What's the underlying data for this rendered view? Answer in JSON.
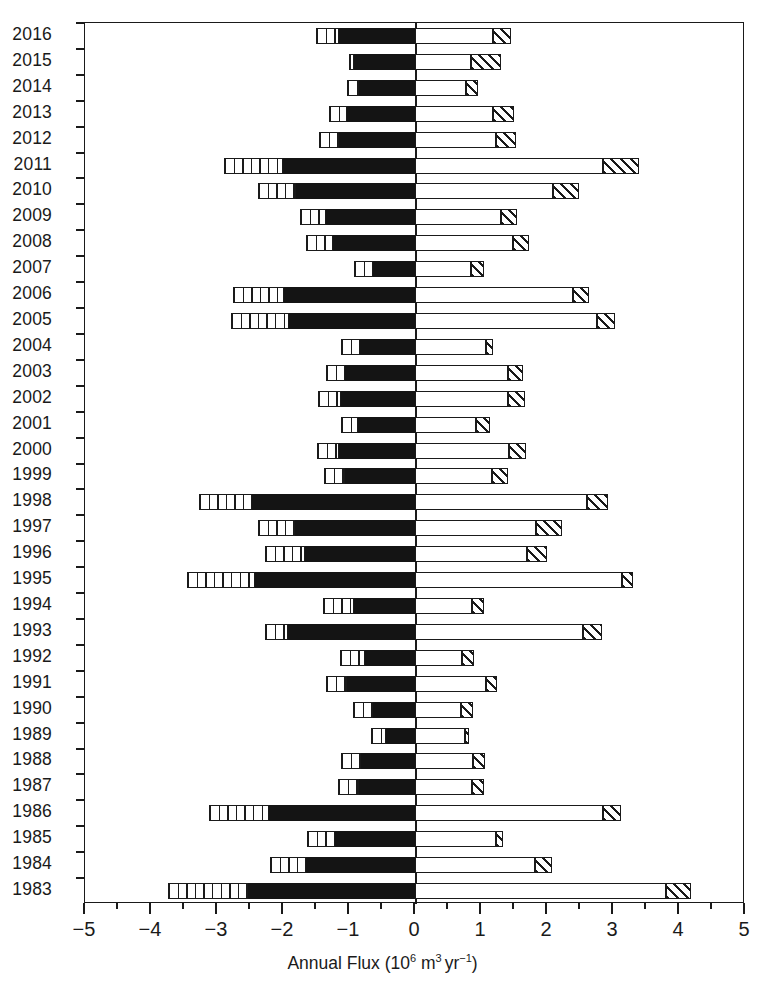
{
  "chart_data": {
    "type": "bar",
    "orientation": "horizontal",
    "title": "",
    "xlabel": "Annual Flux (10^6 m^3 yr^-1)",
    "xlabel_parts": {
      "text_lead": "Annual Flux (10",
      "exp1": "6",
      "unit_m": " m",
      "exp2": "3",
      "unit_yr": "yr",
      "exp3": "−1",
      "text_tail": ")"
    },
    "ylabel": "",
    "xlim": [
      -5,
      5
    ],
    "xticks": [
      -5,
      -4,
      -3,
      -2,
      -1,
      0,
      1,
      2,
      3,
      4,
      5
    ],
    "xtick_labels": [
      "−5",
      "−4",
      "−3",
      "−2",
      "−1",
      "0",
      "1",
      "2",
      "3",
      "4",
      "5"
    ],
    "x_minor_tick_step": 0.5,
    "grid": false,
    "legend": null,
    "categories": [
      "2016",
      "2015",
      "2014",
      "2013",
      "2012",
      "2011",
      "2010",
      "2009",
      "2008",
      "2007",
      "2006",
      "2005",
      "2004",
      "2003",
      "2002",
      "2001",
      "2000",
      "1999",
      "1998",
      "1997",
      "1996",
      "1995",
      "1994",
      "1993",
      "1992",
      "1991",
      "1990",
      "1989",
      "1988",
      "1987",
      "1986",
      "1985",
      "1984",
      "1983"
    ],
    "series": [
      {
        "name": "negative-vertical-hatch",
        "pattern": "vertical-hatch",
        "color": "#ffffff"
      },
      {
        "name": "negative-solid",
        "pattern": "solid",
        "color": "#141414"
      },
      {
        "name": "positive-white",
        "pattern": "open",
        "color": "#ffffff"
      },
      {
        "name": "positive-diagonal-hatch",
        "pattern": "diagonal-hatch",
        "color": "#ffffff"
      }
    ],
    "rows": [
      {
        "year": "2016",
        "neg_start": -1.5,
        "neg_hatch_end": -1.15,
        "neg_end": 0,
        "pos_white_end": 1.18,
        "pos_end": 1.45
      },
      {
        "year": "2015",
        "neg_start": -1.0,
        "neg_hatch_end": -0.92,
        "neg_end": 0,
        "pos_white_end": 0.85,
        "pos_end": 1.3
      },
      {
        "year": "2014",
        "neg_start": -1.03,
        "neg_hatch_end": -0.85,
        "neg_end": 0,
        "pos_white_end": 0.78,
        "pos_end": 0.96
      },
      {
        "year": "2013",
        "neg_start": -1.3,
        "neg_hatch_end": -1.03,
        "neg_end": 0,
        "pos_white_end": 1.18,
        "pos_end": 1.5
      },
      {
        "year": "2012",
        "neg_start": -1.45,
        "neg_hatch_end": -1.15,
        "neg_end": 0,
        "pos_white_end": 1.22,
        "pos_end": 1.53
      },
      {
        "year": "2011",
        "neg_start": -2.9,
        "neg_hatch_end": -2.0,
        "neg_end": 0,
        "pos_white_end": 2.85,
        "pos_end": 3.4
      },
      {
        "year": "2010",
        "neg_start": -2.38,
        "neg_hatch_end": -1.8,
        "neg_end": 0,
        "pos_white_end": 2.09,
        "pos_end": 2.48
      },
      {
        "year": "2009",
        "neg_start": -1.75,
        "neg_hatch_end": -1.35,
        "neg_end": 0,
        "pos_white_end": 1.3,
        "pos_end": 1.55
      },
      {
        "year": "2008",
        "neg_start": -1.65,
        "neg_hatch_end": -1.24,
        "neg_end": 0,
        "pos_white_end": 1.48,
        "pos_end": 1.73
      },
      {
        "year": "2007",
        "neg_start": -0.92,
        "neg_hatch_end": -0.64,
        "neg_end": 0,
        "pos_white_end": 0.85,
        "pos_end": 1.04
      },
      {
        "year": "2006",
        "neg_start": -2.76,
        "neg_hatch_end": -1.98,
        "neg_end": 0,
        "pos_white_end": 2.4,
        "pos_end": 2.64
      },
      {
        "year": "2005",
        "neg_start": -2.79,
        "neg_hatch_end": -1.91,
        "neg_end": 0,
        "pos_white_end": 2.76,
        "pos_end": 3.03
      },
      {
        "year": "2004",
        "neg_start": -1.12,
        "neg_hatch_end": -0.83,
        "neg_end": 0,
        "pos_white_end": 1.08,
        "pos_end": 1.18
      },
      {
        "year": "2003",
        "neg_start": -1.35,
        "neg_hatch_end": -1.06,
        "neg_end": 0,
        "pos_white_end": 1.41,
        "pos_end": 1.63
      },
      {
        "year": "2002",
        "neg_start": -1.47,
        "neg_hatch_end": -1.12,
        "neg_end": 0,
        "pos_white_end": 1.41,
        "pos_end": 1.67
      },
      {
        "year": "2001",
        "neg_start": -1.12,
        "neg_hatch_end": -0.86,
        "neg_end": 0,
        "pos_white_end": 0.93,
        "pos_end": 1.14
      },
      {
        "year": "2000",
        "neg_start": -1.48,
        "neg_hatch_end": -1.15,
        "neg_end": 0,
        "pos_white_end": 1.42,
        "pos_end": 1.68
      },
      {
        "year": "1999",
        "neg_start": -1.38,
        "neg_hatch_end": -1.06,
        "neg_end": 0,
        "pos_white_end": 1.16,
        "pos_end": 1.41
      },
      {
        "year": "1998",
        "neg_start": -3.27,
        "neg_hatch_end": -2.47,
        "neg_end": 0,
        "pos_white_end": 2.6,
        "pos_end": 2.92
      },
      {
        "year": "1997",
        "neg_start": -2.38,
        "neg_hatch_end": -1.82,
        "neg_end": 0,
        "pos_white_end": 1.83,
        "pos_end": 2.22
      },
      {
        "year": "1996",
        "neg_start": -2.27,
        "neg_hatch_end": -1.67,
        "neg_end": 0,
        "pos_white_end": 1.7,
        "pos_end": 2.0
      },
      {
        "year": "1995",
        "neg_start": -3.45,
        "neg_hatch_end": -2.42,
        "neg_end": 0,
        "pos_white_end": 3.13,
        "pos_end": 3.3
      },
      {
        "year": "1994",
        "neg_start": -1.4,
        "neg_hatch_end": -0.92,
        "neg_end": 0,
        "pos_white_end": 0.87,
        "pos_end": 1.05
      },
      {
        "year": "1993",
        "neg_start": -2.27,
        "neg_hatch_end": -1.92,
        "neg_end": 0,
        "pos_white_end": 2.54,
        "pos_end": 2.84
      },
      {
        "year": "1992",
        "neg_start": -1.13,
        "neg_hatch_end": -0.76,
        "neg_end": 0,
        "pos_white_end": 0.71,
        "pos_end": 0.89
      },
      {
        "year": "1991",
        "neg_start": -1.35,
        "neg_hatch_end": -1.03,
        "neg_end": 0,
        "pos_white_end": 1.07,
        "pos_end": 1.24
      },
      {
        "year": "1990",
        "neg_start": -0.94,
        "neg_hatch_end": -0.64,
        "neg_end": 0,
        "pos_white_end": 0.7,
        "pos_end": 0.88
      },
      {
        "year": "1989",
        "neg_start": -0.67,
        "neg_hatch_end": -0.44,
        "neg_end": 0,
        "pos_white_end": 0.76,
        "pos_end": 0.82
      },
      {
        "year": "1988",
        "neg_start": -1.12,
        "neg_hatch_end": -0.82,
        "neg_end": 0,
        "pos_white_end": 0.88,
        "pos_end": 1.06
      },
      {
        "year": "1987",
        "neg_start": -1.16,
        "neg_hatch_end": -0.85,
        "neg_end": 0,
        "pos_white_end": 0.87,
        "pos_end": 1.05
      },
      {
        "year": "1986",
        "neg_start": -3.12,
        "neg_hatch_end": -2.21,
        "neg_end": 0,
        "pos_white_end": 2.85,
        "pos_end": 3.12
      },
      {
        "year": "1985",
        "neg_start": -1.63,
        "neg_hatch_end": -1.21,
        "neg_end": 0,
        "pos_white_end": 1.23,
        "pos_end": 1.33
      },
      {
        "year": "1984",
        "neg_start": -2.19,
        "neg_hatch_end": -1.65,
        "neg_end": 0,
        "pos_white_end": 1.82,
        "pos_end": 2.08
      },
      {
        "year": "1983",
        "neg_start": -3.75,
        "neg_hatch_end": -2.53,
        "neg_end": 0,
        "pos_white_end": 3.8,
        "pos_end": 4.18
      }
    ]
  }
}
